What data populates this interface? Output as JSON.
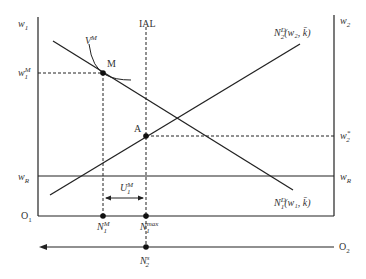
{
  "diagram": {
    "type": "labor market dual-sector wage diagram",
    "axes": {
      "left_axis_label": "w",
      "left_axis_sub": "1",
      "right_axis_label": "w",
      "right_axis_sub": "2",
      "origin_left": "O",
      "origin_left_sub": "1",
      "origin_right": "O",
      "origin_right_sub": "2"
    },
    "lines": {
      "ial_label": "IAL",
      "vm_label": "V",
      "vm_sup": "M",
      "demand2_main": "N",
      "demand2_sub": "2",
      "demand2_sup": "D",
      "demand2_args": "(w₂, k̄)",
      "demand1_main": "N",
      "demand1_sub": "1",
      "demand1_sup": "D",
      "demand1_args": "(w₁, k̄)"
    },
    "points": {
      "m_label": "M",
      "a_label": "A"
    },
    "wage_levels": {
      "w1m_main": "w",
      "w1m_sub": "1",
      "w1m_sup": "M",
      "w2star_main": "w",
      "w2star_sub": "2",
      "w2star_sup": "*",
      "wr_left_main": "w",
      "wr_left_sub": "R",
      "wr_right_main": "w",
      "wr_right_sub": "R"
    },
    "quantities": {
      "u1m_main": "U",
      "u1m_sub": "1",
      "u1m_sup": "M",
      "n1m_main": "N",
      "n1m_sub": "1",
      "n1m_sup": "M",
      "n1max_main": "N",
      "n1max_sub": "1",
      "n1max_sup": "max",
      "n2s_main": "N",
      "n2s_sub": "2",
      "n2s_sup": "s"
    },
    "colors": {
      "line": "#222222",
      "text": "#333333"
    }
  }
}
